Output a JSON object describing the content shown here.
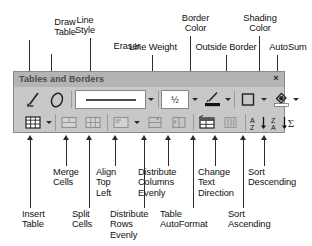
{
  "toolbar": {
    "title": "Tables and Borders",
    "close_label": "×",
    "line_weight_value": "½",
    "autosum_symbol": "Σ",
    "sort_ascending_symbol": "A↓",
    "sort_descending_symbol": "Z↓",
    "row1_buttons": [
      {
        "name": "draw-table",
        "label": "Draw Table"
      },
      {
        "name": "eraser",
        "label": "Eraser"
      },
      {
        "name": "line-style",
        "label": "Line Style"
      },
      {
        "name": "line-weight",
        "label": "Line Weight"
      },
      {
        "name": "border-color",
        "label": "Border Color"
      },
      {
        "name": "outside-border",
        "label": "Outside Border"
      },
      {
        "name": "shading-color",
        "label": "Shading Color"
      },
      {
        "name": "autosum",
        "label": "AutoSum"
      }
    ],
    "row2_buttons": [
      {
        "name": "insert-table",
        "label": "Insert Table"
      },
      {
        "name": "merge-cells",
        "label": "Merge Cells"
      },
      {
        "name": "split-cells",
        "label": "Split Cells"
      },
      {
        "name": "align-top-left",
        "label": "Align Top Left"
      },
      {
        "name": "distribute-rows-evenly",
        "label": "Distribute Rows Evenly"
      },
      {
        "name": "distribute-columns-evenly",
        "label": "Distribute Columns Evenly"
      },
      {
        "name": "table-autoformat",
        "label": "Table AutoFormat"
      },
      {
        "name": "change-text-direction",
        "label": "Change Text Direction"
      },
      {
        "name": "sort-ascending",
        "label": "Sort Ascending"
      },
      {
        "name": "sort-descending",
        "label": "Sort Descending"
      }
    ]
  },
  "callouts_top": [
    {
      "id": "draw-table",
      "text": "Draw\nTable"
    },
    {
      "id": "eraser",
      "text": "Eraser"
    },
    {
      "id": "line-style",
      "text": "Line\nStyle"
    },
    {
      "id": "line-weight",
      "text": "Line Weight"
    },
    {
      "id": "border-color",
      "text": "Border\nColor"
    },
    {
      "id": "outside-border",
      "text": "Outside Border"
    },
    {
      "id": "shading-color",
      "text": "Shading\nColor"
    },
    {
      "id": "autosum",
      "text": "AutoSum"
    }
  ],
  "callouts_bottom": [
    {
      "id": "insert-table",
      "text": "Insert\nTable"
    },
    {
      "id": "merge-cells",
      "text": "Merge\nCells"
    },
    {
      "id": "split-cells",
      "text": "Split\nCells"
    },
    {
      "id": "align-top-left",
      "text": "Align\nTop\nLeft"
    },
    {
      "id": "distribute-rows-evenly",
      "text": "Distribute\nRows\nEvenly"
    },
    {
      "id": "distribute-columns-evenly",
      "text": "Distribute\nColumns\nEvenly"
    },
    {
      "id": "table-autoformat",
      "text": "Table\nAutoFormat"
    },
    {
      "id": "change-text-direction",
      "text": "Change\nText\nDirection"
    },
    {
      "id": "sort-ascending",
      "text": "Sort\nAscending"
    },
    {
      "id": "sort-descending",
      "text": "Sort\nDescending"
    }
  ],
  "colors": {
    "toolbar_face": "#c8c8c8",
    "titlebar": "#b4b4b4",
    "ink": "#2b2b2b",
    "border_color_swatch": "#1a1a1a",
    "shading_color_swatch": "#ffffff"
  }
}
